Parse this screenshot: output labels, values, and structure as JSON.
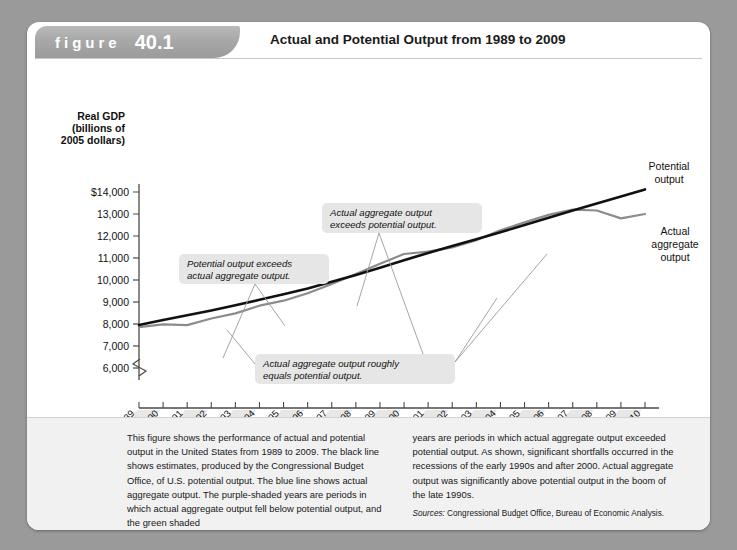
{
  "figure": {
    "word": "figure",
    "number": "40.1",
    "title": "Actual and Potential Output from 1989 to 2009"
  },
  "axes": {
    "y_title_lines": [
      "Real GDP",
      "(billions of",
      "2005 dollars)"
    ],
    "x_title": "Year",
    "y_ticks": [
      "$14,000",
      "13,000",
      "12,000",
      "11,000",
      "10,000",
      "9,000",
      "8,000",
      "7,000",
      "6,000"
    ],
    "x_ticks": [
      "1989",
      "1990",
      "1991",
      "1992",
      "1993",
      "1994",
      "1995",
      "1996",
      "1997",
      "1998",
      "1999",
      "2000",
      "2001",
      "2002",
      "2003",
      "2004",
      "2005",
      "2006",
      "2007",
      "2008",
      "2009",
      "2010"
    ]
  },
  "series_labels": {
    "potential": [
      "Potential",
      "output"
    ],
    "actual": [
      "Actual",
      "aggregate",
      "output"
    ]
  },
  "callouts": [
    {
      "id": "potential-exceeds-actual",
      "lines": [
        "Potential output exceeds",
        "actual aggregate output."
      ]
    },
    {
      "id": "actual-exceeds-potential",
      "lines": [
        "Actual aggregate output",
        "exceeds potential output."
      ]
    },
    {
      "id": "actual-equals-potential",
      "lines": [
        "Actual aggregate output roughly",
        "equals potential output."
      ]
    }
  ],
  "caption": {
    "left": "This figure shows the performance of actual and potential output in the United States from 1989 to 2009. The black line shows estimates, produced by the Congressional Budget Office, of U.S. potential output. The blue line shows actual aggregate output. The purple-shaded years are periods in which actual aggregate output fell below potential output, and the green shaded",
    "right": "years are periods in which actual aggregate output exceeded potential output. As shown, significant shortfalls occurred in the recessions of the early 1990s and after 2000. Actual aggregate output was significantly above potential output in the boom of the late 1990s.",
    "sources_label": "Sources:",
    "sources_text": " Congressional Budget Office, Bureau of Economic Analysis."
  },
  "colors": {
    "page_background": "#9a9a9a",
    "card": "#ffffff",
    "banner": "#a8a8a8",
    "potential_line": "#111111",
    "actual_line": "#8c8c8c",
    "callout_box": "#e6e6e6",
    "caption_background": "#f1f1f1"
  },
  "chart_data": {
    "type": "line",
    "title": "Actual and Potential Output from 1989 to 2009",
    "xlabel": "Year",
    "ylabel": "Real GDP (billions of 2005 dollars)",
    "xlim": [
      1989,
      2010
    ],
    "ylim": [
      6000,
      14500
    ],
    "y_axis_break": true,
    "grid": false,
    "x": [
      1989,
      1990,
      1991,
      1992,
      1993,
      1994,
      1995,
      1996,
      1997,
      1998,
      1999,
      2000,
      2001,
      2002,
      2003,
      2004,
      2005,
      2006,
      2007,
      2008,
      2009,
      2010
    ],
    "series": [
      {
        "name": "Potential output",
        "color": "#111111",
        "values": [
          7950,
          8180,
          8400,
          8620,
          8850,
          9100,
          9350,
          9620,
          9920,
          10230,
          10560,
          10900,
          11230,
          11540,
          11850,
          12170,
          12500,
          12830,
          13160,
          13480,
          13800,
          14120
        ]
      },
      {
        "name": "Actual aggregate output",
        "color": "#8c8c8c",
        "values": [
          7860,
          7980,
          7950,
          8250,
          8480,
          8830,
          9060,
          9400,
          9820,
          10270,
          10740,
          11180,
          11290,
          11480,
          11810,
          12260,
          12620,
          12960,
          13200,
          13160,
          12800,
          13000
        ]
      }
    ]
  }
}
